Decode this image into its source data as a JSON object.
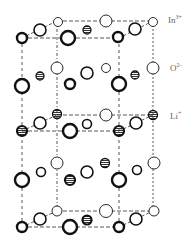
{
  "diagram": {
    "title": "",
    "legend": [
      {
        "id": "in",
        "base": "In",
        "charge": "3+",
        "x": 168,
        "y": 14
      },
      {
        "id": "o",
        "base": "O",
        "charge": "2-",
        "x": 170,
        "y": 62
      },
      {
        "id": "li",
        "base": "Li",
        "charge": "+",
        "x": 170,
        "y": 110
      }
    ],
    "frame": {
      "front_left_x": 22,
      "front_right_x": 119,
      "back_left_x": 57,
      "back_right_x": 153,
      "front_top_y": 38,
      "back_top_y": 21,
      "front_bottom_y": 227,
      "back_bottom_y": 211
    },
    "atoms": [
      {
        "x": 22,
        "y": 38,
        "r": 5,
        "style": "bold"
      },
      {
        "x": 40,
        "y": 30,
        "r": 6,
        "style": "medium"
      },
      {
        "x": 58,
        "y": 22,
        "r": 4.5,
        "style": "thin"
      },
      {
        "x": 68,
        "y": 38,
        "r": 7,
        "style": "bold"
      },
      {
        "x": 87,
        "y": 30,
        "r": 4,
        "style": "striped"
      },
      {
        "x": 106,
        "y": 21,
        "r": 6,
        "style": "thin"
      },
      {
        "x": 118,
        "y": 37,
        "r": 5,
        "style": "bold"
      },
      {
        "x": 135,
        "y": 29,
        "r": 6,
        "style": "medium"
      },
      {
        "x": 153,
        "y": 22,
        "r": 4.5,
        "style": "thin"
      },
      {
        "x": 22,
        "y": 86,
        "r": 7,
        "style": "bold"
      },
      {
        "x": 40,
        "y": 76,
        "r": 4,
        "style": "striped"
      },
      {
        "x": 57,
        "y": 68,
        "r": 6,
        "style": "thin"
      },
      {
        "x": 70,
        "y": 84,
        "r": 5,
        "style": "bold"
      },
      {
        "x": 87,
        "y": 73,
        "r": 6,
        "style": "medium"
      },
      {
        "x": 106,
        "y": 68,
        "r": 4.5,
        "style": "thin"
      },
      {
        "x": 119,
        "y": 84,
        "r": 7,
        "style": "bold"
      },
      {
        "x": 135,
        "y": 75,
        "r": 4,
        "style": "striped"
      },
      {
        "x": 153,
        "y": 68,
        "r": 6,
        "style": "thin"
      },
      {
        "x": 22,
        "y": 131,
        "r": 5,
        "style": "striped-dark"
      },
      {
        "x": 40,
        "y": 123,
        "r": 6,
        "style": "medium"
      },
      {
        "x": 57,
        "y": 114,
        "r": 4.5,
        "style": "striped"
      },
      {
        "x": 70,
        "y": 131,
        "r": 7,
        "style": "bold"
      },
      {
        "x": 87,
        "y": 124,
        "r": 4.5,
        "style": "medium"
      },
      {
        "x": 106,
        "y": 115,
        "r": 6,
        "style": "thin"
      },
      {
        "x": 119,
        "y": 131,
        "r": 5,
        "style": "striped-dark"
      },
      {
        "x": 136,
        "y": 123,
        "r": 6,
        "style": "medium"
      },
      {
        "x": 153,
        "y": 115,
        "r": 4.5,
        "style": "striped"
      },
      {
        "x": 22,
        "y": 180,
        "r": 7,
        "style": "bold"
      },
      {
        "x": 41,
        "y": 172,
        "r": 4.5,
        "style": "medium"
      },
      {
        "x": 57,
        "y": 163,
        "r": 6,
        "style": "thin"
      },
      {
        "x": 70,
        "y": 180,
        "r": 5,
        "style": "striped-dark"
      },
      {
        "x": 87,
        "y": 172,
        "r": 6,
        "style": "medium"
      },
      {
        "x": 105,
        "y": 163,
        "r": 4.5,
        "style": "striped"
      },
      {
        "x": 119,
        "y": 180,
        "r": 7,
        "style": "bold"
      },
      {
        "x": 137,
        "y": 170,
        "r": 4.5,
        "style": "medium"
      },
      {
        "x": 154,
        "y": 163,
        "r": 6,
        "style": "thin"
      },
      {
        "x": 22,
        "y": 227,
        "r": 5,
        "style": "bold"
      },
      {
        "x": 40,
        "y": 219,
        "r": 6,
        "style": "medium"
      },
      {
        "x": 57,
        "y": 211,
        "r": 5,
        "style": "thin"
      },
      {
        "x": 70,
        "y": 227,
        "r": 7,
        "style": "bold"
      },
      {
        "x": 87,
        "y": 220,
        "r": 4.5,
        "style": "striped-dark"
      },
      {
        "x": 106,
        "y": 211,
        "r": 6.5,
        "style": "thin"
      },
      {
        "x": 119,
        "y": 227,
        "r": 5,
        "style": "bold"
      },
      {
        "x": 136,
        "y": 219,
        "r": 6,
        "style": "medium"
      },
      {
        "x": 154,
        "y": 211,
        "r": 5,
        "style": "thin"
      }
    ]
  }
}
